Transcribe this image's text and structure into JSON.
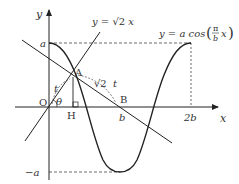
{
  "figure": {
    "type": "math-diagram",
    "axes": {
      "x_label": "x",
      "y_label": "y",
      "origin_label": "O"
    },
    "curve_label": {
      "prefix": "y = a cos",
      "fraction_num": "π",
      "fraction_den": "b",
      "suffix": "x"
    },
    "line_label": {
      "prefix": "y = ",
      "root": "√2",
      "suffix": " x"
    },
    "tick_labels": {
      "a": "a",
      "neg_a": "−a",
      "b": "b",
      "two_b": "2b"
    },
    "point_labels": {
      "A": "A",
      "B": "B",
      "H": "H"
    },
    "segment_labels": {
      "OA": "t",
      "AB_root": "√2",
      "AB_t": "t"
    },
    "angle_label": "θ",
    "colors": {
      "stroke": "#222222",
      "text": "#333333"
    }
  }
}
